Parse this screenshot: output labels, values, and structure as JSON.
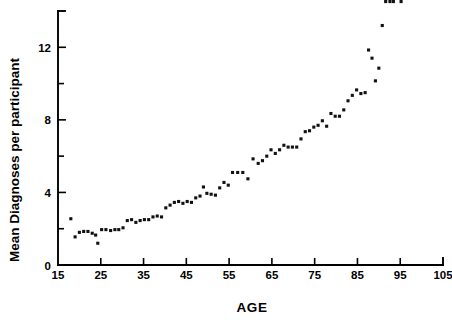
{
  "chart_data": {
    "type": "scatter",
    "title": "",
    "xlabel": "AGE",
    "ylabel": "Mean Diagnoses per participant",
    "xlim": [
      15,
      105
    ],
    "ylim": [
      0,
      14
    ],
    "grid": false,
    "legend": null,
    "marker": "square-dot",
    "marker_color": "#111111",
    "x_ticks_major": [
      15,
      25,
      35,
      45,
      55,
      65,
      75,
      85,
      95,
      105
    ],
    "x_tick_labels": [
      "15",
      "25",
      "35",
      "45",
      "55",
      "65",
      "75",
      "85",
      "95",
      "105"
    ],
    "y_ticks_major": [
      0,
      4,
      8,
      12
    ],
    "y_tick_labels": [
      "0",
      "4",
      "8",
      "12"
    ],
    "y_ticks_minor": [
      2,
      6,
      10,
      14
    ],
    "x": [
      18,
      19,
      20,
      21,
      22,
      23,
      23.8,
      24.3,
      25.2,
      26.2,
      27.3,
      28.3,
      29.2,
      30.2,
      31.2,
      32.2,
      33.2,
      34.2,
      35.2,
      36.2,
      37.2,
      38.2,
      39.2,
      40.2,
      41.2,
      42.2,
      43.2,
      44.2,
      45.2,
      46.2,
      47.2,
      48.2,
      49.0,
      49.8,
      50.8,
      51.8,
      52.8,
      53.8,
      54.8,
      55.8,
      57.0,
      58.2,
      59.4,
      60.6,
      61.8,
      62.8,
      63.8,
      64.8,
      65.8,
      66.8,
      67.8,
      68.8,
      69.8,
      70.8,
      71.8,
      72.8,
      73.8,
      74.8,
      75.8,
      76.8,
      77.8,
      78.8,
      79.8,
      80.8,
      81.8,
      82.8,
      83.8,
      84.8,
      85.8,
      86.8,
      87.6,
      88.4,
      89.2,
      90.0,
      90.8,
      91.6,
      92.6,
      93.4,
      95.2
    ],
    "y": [
      2.55,
      1.55,
      1.8,
      1.85,
      1.85,
      1.75,
      1.65,
      1.2,
      1.95,
      1.95,
      1.9,
      1.95,
      1.95,
      2.05,
      2.45,
      2.5,
      2.35,
      2.45,
      2.5,
      2.5,
      2.65,
      2.7,
      2.65,
      3.15,
      3.3,
      3.45,
      3.5,
      3.4,
      3.5,
      3.45,
      3.7,
      3.8,
      4.3,
      3.95,
      3.9,
      3.85,
      4.25,
      4.55,
      4.4,
      5.1,
      5.1,
      5.1,
      4.75,
      5.85,
      5.6,
      5.75,
      6.0,
      6.35,
      6.15,
      6.35,
      6.6,
      6.5,
      6.5,
      6.5,
      6.95,
      7.35,
      7.4,
      7.6,
      7.7,
      7.95,
      7.65,
      8.35,
      8.2,
      8.2,
      8.55,
      9.05,
      9.35,
      9.65,
      9.45,
      9.5,
      11.85,
      11.4,
      10.15,
      10.85,
      13.2
    ],
    "n_points": 79
  },
  "axes": {
    "x_axis_name": "AGE",
    "y_axis_name": "Mean Diagnoses per participant"
  }
}
